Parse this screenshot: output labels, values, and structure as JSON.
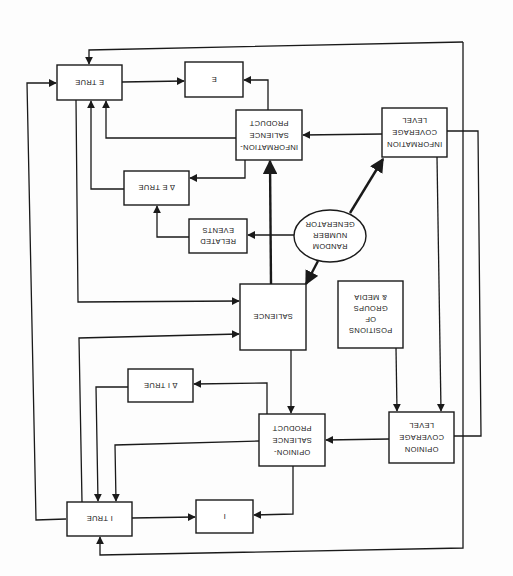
{
  "diagram": {
    "orientation": "rotated 180 degrees (scanned upside-down)",
    "nodes": {
      "e_true": {
        "label": [
          "E TRUE"
        ]
      },
      "e": {
        "label": [
          "E"
        ]
      },
      "info_salience_product": {
        "label": [
          "INFORMATION-",
          "SALIENCE",
          "PRODUCT"
        ]
      },
      "info_coverage_level": {
        "label": [
          "INFORMATION",
          "COVERAGE",
          "LEVEL"
        ]
      },
      "delta_e_true": {
        "label": [
          "∆ E TRUE"
        ]
      },
      "related_events": {
        "label": [
          "RELATED",
          "EVENTS"
        ]
      },
      "random_number_generator": {
        "label": [
          "RANDOM",
          "NUMBER",
          "GENERATOR"
        ]
      },
      "salience": {
        "label": [
          "SALIENCE"
        ]
      },
      "positions_groups_media": {
        "label": [
          "POSITIONS",
          "OF",
          "GROUPS",
          "& MEDIA"
        ]
      },
      "delta_i_true": {
        "label": [
          "∆ I TRUE"
        ]
      },
      "opinion_salience_product": {
        "label": [
          "OPINION-",
          "SALIENCE",
          "PRODUCT"
        ]
      },
      "opinion_coverage_level": {
        "label": [
          "OPINION",
          "COVERAGE",
          "LEVEL"
        ]
      },
      "i_true": {
        "label": [
          "I TRUE"
        ]
      },
      "i": {
        "label": [
          "I"
        ]
      }
    },
    "edges": [
      {
        "from": "E TRUE",
        "to": "E"
      },
      {
        "from": "INFORMATION-SALIENCE PRODUCT",
        "to": "E"
      },
      {
        "from": "INFORMATION-SALIENCE PRODUCT",
        "to": "E TRUE"
      },
      {
        "from": "INFORMATION-SALIENCE PRODUCT",
        "to": "∆ E TRUE"
      },
      {
        "from": "INFORMATION COVERAGE LEVEL",
        "to": "INFORMATION-SALIENCE PRODUCT"
      },
      {
        "from": "INFORMATION COVERAGE LEVEL",
        "to": "OPINION COVERAGE LEVEL"
      },
      {
        "from": "∆ E TRUE",
        "to": "E TRUE"
      },
      {
        "from": "RELATED EVENTS",
        "to": "∆ E TRUE"
      },
      {
        "from": "RANDOM NUMBER GENERATOR",
        "to": "RELATED EVENTS"
      },
      {
        "from": "RANDOM NUMBER GENERATOR",
        "to": "INFORMATION COVERAGE LEVEL"
      },
      {
        "from": "RANDOM NUMBER GENERATOR",
        "to": "SALIENCE"
      },
      {
        "from": "SALIENCE",
        "to": "INFORMATION-SALIENCE PRODUCT"
      },
      {
        "from": "SALIENCE",
        "to": "OPINION-SALIENCE PRODUCT"
      },
      {
        "from": "E TRUE",
        "to": "SALIENCE"
      },
      {
        "from": "I TRUE",
        "to": "SALIENCE"
      },
      {
        "from": "POSITIONS OF GROUPS & MEDIA",
        "to": "OPINION COVERAGE LEVEL"
      },
      {
        "from": "OPINION COVERAGE LEVEL",
        "to": "OPINION-SALIENCE PRODUCT"
      },
      {
        "from": "OPINION-SALIENCE PRODUCT",
        "to": "I"
      },
      {
        "from": "OPINION-SALIENCE PRODUCT",
        "to": "I TRUE"
      },
      {
        "from": "OPINION-SALIENCE PRODUCT",
        "to": "∆ I TRUE"
      },
      {
        "from": "∆ I TRUE",
        "to": "I TRUE"
      },
      {
        "from": "I TRUE",
        "to": "I"
      },
      {
        "from": "I TRUE",
        "to": "E TRUE"
      },
      {
        "from": "E TRUE",
        "to": "I TRUE"
      },
      {
        "from": "outer feedback loop",
        "to": "E TRUE"
      },
      {
        "from": "outer feedback loop",
        "to": "I TRUE"
      }
    ]
  }
}
